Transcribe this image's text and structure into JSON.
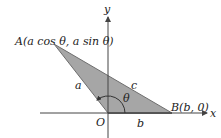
{
  "diagram": {
    "type": "triangle-on-axes",
    "axes": {
      "x_label": "x",
      "y_label": "y"
    },
    "points": {
      "A": {
        "label": "A(a cos θ, a sin θ)"
      },
      "O": {
        "label": "O"
      },
      "B": {
        "label": "B(b, 0)"
      }
    },
    "sides": {
      "OA": "a",
      "AB": "c",
      "OB": "b"
    },
    "angle": {
      "label": "θ"
    },
    "colors": {
      "fill": "#a6a6a6",
      "stroke": "#6e6e6e",
      "axis": "#444444"
    }
  }
}
